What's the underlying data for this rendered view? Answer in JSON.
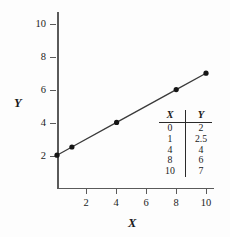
{
  "chart_data": {
    "type": "line",
    "title": "",
    "xlabel": "X",
    "ylabel": "Y",
    "xlim": [
      0,
      11
    ],
    "ylim": [
      0,
      11
    ],
    "grid": false,
    "legend": null,
    "x": [
      0,
      1,
      4,
      8,
      10
    ],
    "values": [
      2,
      2.5,
      4,
      6,
      7
    ],
    "series": [
      {
        "name": "Y",
        "x": [
          0,
          1,
          4,
          8,
          10
        ],
        "values": [
          2,
          2.5,
          4,
          6,
          7
        ]
      }
    ],
    "xticks": [
      2,
      4,
      6,
      8,
      10
    ],
    "yticks": [
      2,
      4,
      6,
      8,
      10
    ],
    "xtick_labels": [
      "2",
      "4",
      "6",
      "8",
      "10"
    ],
    "ytick_labels": [
      "2",
      "4",
      "6",
      "8",
      "10"
    ],
    "marker": "filled-circle",
    "table": {
      "headers": [
        "X",
        "Y"
      ],
      "rows": [
        [
          "0",
          "2"
        ],
        [
          "1",
          "2.5"
        ],
        [
          "4",
          "4"
        ],
        [
          "8",
          "6"
        ],
        [
          "10",
          "7"
        ]
      ]
    }
  }
}
